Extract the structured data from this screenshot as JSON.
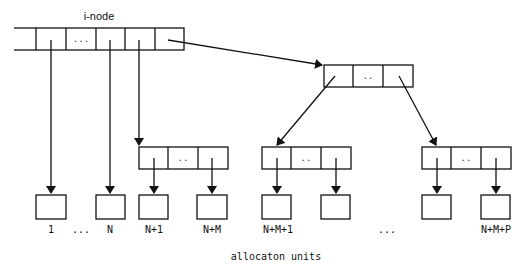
{
  "diagram": {
    "inode_label": "i-node",
    "inode_dots": "...",
    "indirect_dots": "..",
    "footer_label": "allocaton units",
    "units": [
      {
        "label": "1"
      },
      {
        "label": "..."
      },
      {
        "label": "N"
      },
      {
        "label": "N+1"
      },
      {
        "label": "N+M"
      },
      {
        "label": "N+M+1"
      },
      {
        "label": "..."
      },
      {
        "label": "N+M+P"
      }
    ],
    "colors": {
      "stroke": "#111111",
      "background": "#ffffff"
    }
  }
}
